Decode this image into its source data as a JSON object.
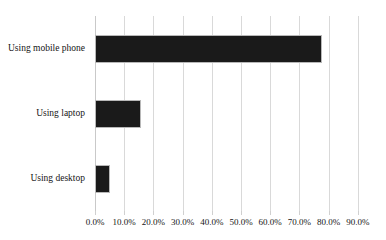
{
  "chart_data": {
    "type": "bar",
    "orientation": "horizontal",
    "title": "",
    "subtitle": "",
    "xlabel": "",
    "ylabel": "",
    "categories": [
      "Using mobile phone",
      "Using laptop",
      "Using desktop"
    ],
    "values": [
      77.6,
      15.8,
      5.1
    ],
    "value_format": "percent",
    "xlim": [
      0,
      90
    ],
    "xtick_step": 10,
    "xtick_labels": [
      "0.0%",
      "10.0%",
      "20.0%",
      "30.0%",
      "40.0%",
      "50.0%",
      "60.0%",
      "70.0%",
      "80.0%",
      "90.0%"
    ],
    "xtick_values": [
      0,
      10,
      20,
      30,
      40,
      50,
      60,
      70,
      80,
      90
    ],
    "grid": {
      "vertical": true,
      "horizontal": false,
      "color": "#d9d9d9"
    },
    "legend": {
      "visible": false,
      "entries": []
    },
    "series": [
      {
        "name": "Share of respondents",
        "color": "#1a1a1a",
        "outline_color": "#b8b8b8",
        "values": [
          77.6,
          15.8,
          5.1
        ]
      }
    ],
    "data_labels": false,
    "background_color": "#ffffff",
    "text_color": "#151515"
  }
}
